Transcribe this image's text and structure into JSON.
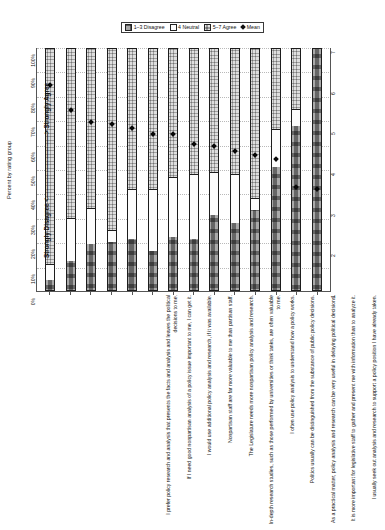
{
  "legend": {
    "items": [
      {
        "label": "1–3 Disagree",
        "swatch": "disagree-swatch"
      },
      {
        "label": "4 Neutral",
        "swatch": "neutral-swatch"
      },
      {
        "label": "5–7 Agree",
        "swatch": "agree-swatch"
      },
      {
        "label": "Mean",
        "swatch": "mean-diamond-marker"
      }
    ]
  },
  "axes": {
    "percent_axis_title": "Percent by rating group",
    "percent_ticks": [
      "0%",
      "10%",
      "20%",
      "30%",
      "40%",
      "50%",
      "60%",
      "70%",
      "80%",
      "90%",
      "100%"
    ],
    "mean_axis_title": "Strongly Disagree <——————————> Strongly Agree",
    "mean_ticks": [
      "1",
      "2",
      "3",
      "4",
      "5",
      "6",
      "7"
    ]
  },
  "chart_data": {
    "type": "bar",
    "title": "",
    "xlabel": "",
    "ylabel": "Percent by rating group",
    "ylim": [
      0,
      100
    ],
    "orientation": "vertical-stacked-100",
    "secondary_axis": {
      "label": "Strongly Disagree <——————————> Strongly Agree",
      "range": [
        1,
        7
      ],
      "ticks": [
        1,
        2,
        3,
        4,
        5,
        6,
        7
      ]
    },
    "categories": [
      "I prefer policy research and analysis that presents the facts and analysis and leaves the political decisions to me.",
      "If I need good nonpartisan analysis of a policy issue important to me, I can get it.",
      "I would use additional policy analysis and research, if it was available.",
      "Nonpartisan staff are far more valuable to me than partisan staff.",
      "The Legislature needs more nonpartisan policy analysis and research.",
      "In-depth research studies, such as those performed by universities or think tanks, are often valuable to me.",
      "I often use policy analysis to understand how a policy works.",
      "Politics usually can be distinguished from the substance of public policy decisions.",
      "As a practical matter, policy analysis and research can be very useful in delaying political decisions.",
      "It is more important for legislative staff to gather and present me with information than to analyze it.",
      "I usually seek out analysis and research to support a policy position I have already taken.",
      "Overall, staff support in the Legislature is sufficient.",
      "Legislators have all the information and analysis they need to make good public policy decisions.",
      "Information from partisan sources is not credible."
    ],
    "series": [
      {
        "name": "1–3 Disagree",
        "values": [
          4,
          12,
          19,
          20,
          21,
          16,
          22,
          21,
          31,
          28,
          33,
          51,
          68,
          100
        ]
      },
      {
        "name": "4 Neutral",
        "values": [
          7,
          18,
          15,
          5,
          21,
          26,
          25,
          27,
          18,
          20,
          5,
          16,
          7,
          0
        ]
      },
      {
        "name": "5–7 Agree",
        "values": [
          89,
          70,
          66,
          75,
          58,
          58,
          53,
          52,
          51,
          52,
          62,
          33,
          25,
          0
        ]
      }
    ],
    "means": [
      6.05,
      5.45,
      5.15,
      5.1,
      5.0,
      4.85,
      4.85,
      4.6,
      4.55,
      4.45,
      4.35,
      4.25,
      3.55,
      3.5
    ]
  },
  "colors": {
    "disagree": "#aaaaaa",
    "neutral": "#fcfcfc",
    "agree": "#dedede",
    "mean_marker": "#080808",
    "axis": "#555555",
    "grid": "#b9b9b9"
  }
}
